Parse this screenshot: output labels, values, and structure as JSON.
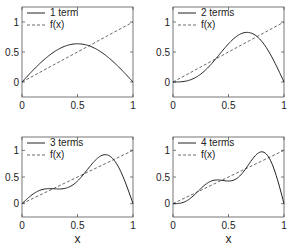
{
  "chart_data": [
    {
      "type": "line",
      "title": "",
      "xlabel": "",
      "ylabel": "",
      "xlim": [
        0,
        1
      ],
      "ylim": [
        -0.25,
        1.25
      ],
      "xticks": [
        "0",
        "0.5",
        "1"
      ],
      "yticks": [
        "0",
        "0.5",
        "1"
      ],
      "grid": false,
      "legend_position": "upper left",
      "series": [
        {
          "name": "1 term",
          "style": "solid",
          "x": [
            0,
            0.1,
            0.2,
            0.3,
            0.4,
            0.5,
            0.6,
            0.7,
            0.8,
            0.9,
            1.0
          ],
          "values": [
            0,
            0.197,
            0.374,
            0.515,
            0.605,
            0.637,
            0.605,
            0.515,
            0.374,
            0.197,
            0
          ]
        },
        {
          "name": "f(x)",
          "style": "dashed",
          "x": [
            0,
            1
          ],
          "values": [
            0,
            1
          ]
        }
      ]
    },
    {
      "type": "line",
      "title": "",
      "xlabel": "",
      "ylabel": "",
      "xlim": [
        0,
        1
      ],
      "ylim": [
        -0.25,
        1.25
      ],
      "xticks": [
        "0",
        "0.5",
        "1"
      ],
      "yticks": [
        "0",
        "0.5",
        "1"
      ],
      "grid": false,
      "legend_position": "upper left",
      "series": [
        {
          "name": "2 terms",
          "style": "solid",
          "x": [
            0,
            0.1,
            0.2,
            0.3,
            0.4,
            0.5,
            0.6,
            0.7,
            0.8,
            0.9,
            1.0
          ],
          "values": [
            0,
            -0.09,
            -0.11,
            0.0,
            0.18,
            0.64,
            0.8,
            0.88,
            0.75,
            0.43,
            0
          ]
        },
        {
          "name": "f(x)",
          "style": "dashed",
          "x": [
            0,
            1
          ],
          "values": [
            0,
            1
          ]
        }
      ]
    },
    {
      "type": "line",
      "title": "",
      "xlabel": "x",
      "ylabel": "",
      "xlim": [
        0,
        1
      ],
      "ylim": [
        -0.25,
        1.25
      ],
      "xticks": [
        "0",
        "0.5",
        "1"
      ],
      "yticks": [
        "0",
        "0.5",
        "1"
      ],
      "grid": false,
      "legend_position": "upper left",
      "series": [
        {
          "name": "3 terms",
          "style": "solid",
          "x": [
            0,
            0.1,
            0.2,
            0.3,
            0.4,
            0.5,
            0.6,
            0.7,
            0.8,
            0.9,
            1.0
          ],
          "values": [
            0,
            0.3,
            0.38,
            0.33,
            0.28,
            0.42,
            0.65,
            0.9,
            0.92,
            0.55,
            0
          ]
        },
        {
          "name": "f(x)",
          "style": "dashed",
          "x": [
            0,
            1
          ],
          "values": [
            0,
            1
          ]
        }
      ]
    },
    {
      "type": "line",
      "title": "",
      "xlabel": "x",
      "ylabel": "",
      "xlim": [
        0,
        1
      ],
      "ylim": [
        -0.25,
        1.25
      ],
      "xticks": [
        "0",
        "0.5",
        "1"
      ],
      "yticks": [
        "0",
        "0.5",
        "1"
      ],
      "grid": false,
      "legend_position": "upper left",
      "series": [
        {
          "name": "4 terms",
          "style": "solid",
          "x": [
            0,
            0.1,
            0.2,
            0.3,
            0.4,
            0.5,
            0.6,
            0.7,
            0.8,
            0.9,
            1.0
          ],
          "values": [
            0,
            -0.07,
            0.12,
            0.4,
            0.49,
            0.43,
            0.57,
            0.87,
            0.99,
            0.72,
            0
          ]
        },
        {
          "name": "f(x)",
          "style": "dashed",
          "x": [
            0,
            1
          ],
          "values": [
            0,
            1
          ]
        }
      ]
    }
  ],
  "panels": [
    {
      "legend": {
        "series1": "1 term",
        "series2": "f(x)"
      },
      "xticks": [
        "0",
        "0.5",
        "1"
      ],
      "yticks": [
        "0",
        "0.5",
        "1"
      ],
      "xlabel": ""
    },
    {
      "legend": {
        "series1": "2 terms",
        "series2": "f(x)"
      },
      "xticks": [
        "0",
        "0.5",
        "1"
      ],
      "yticks": [
        "0",
        "0.5",
        "1"
      ],
      "xlabel": ""
    },
    {
      "legend": {
        "series1": "3 terms",
        "series2": "f(x)"
      },
      "xticks": [
        "0",
        "0.5",
        "1"
      ],
      "yticks": [
        "0",
        "0.5",
        "1"
      ],
      "xlabel": "x"
    },
    {
      "legend": {
        "series1": "4 terms",
        "series2": "f(x)"
      },
      "xticks": [
        "0",
        "0.5",
        "1"
      ],
      "yticks": [
        "0",
        "0.5",
        "1"
      ],
      "xlabel": "x"
    }
  ],
  "colors": {
    "axis": "#555555",
    "curve": "#222222",
    "dashed": "#444444"
  }
}
